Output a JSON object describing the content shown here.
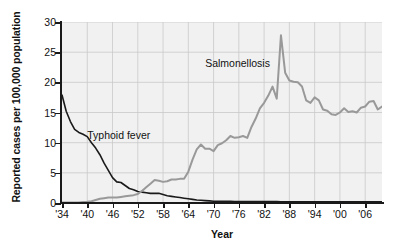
{
  "chart_data": {
    "type": "line",
    "title": "",
    "xlabel": "Year",
    "ylabel": "Reported cases per 100,000 population",
    "xlim": [
      1934,
      2010
    ],
    "ylim": [
      0,
      30
    ],
    "yticks": [
      0,
      5,
      10,
      15,
      20,
      25,
      30
    ],
    "ytick_labels": [
      "0",
      "5",
      "10",
      "15",
      "20",
      "25",
      "30"
    ],
    "xticks": [
      1934,
      1940,
      1946,
      1952,
      1958,
      1964,
      1970,
      1976,
      1982,
      1988,
      1994,
      2000,
      2006
    ],
    "xtick_labels": [
      "'34",
      "'40",
      "'46",
      "'52",
      "'58",
      "'64",
      "'70",
      "'76",
      "'82",
      "'88",
      "'94",
      "'00",
      "'06"
    ],
    "grid": true,
    "legend": "inline-annotations",
    "plot_background": "#f1f1f1",
    "series": [
      {
        "name": "Typhoid fever",
        "color": "#1a1a1a",
        "label_position": {
          "x": 1940,
          "y": 11.3
        },
        "x": [
          1934,
          1935,
          1936,
          1937,
          1938,
          1939,
          1940,
          1941,
          1942,
          1943,
          1944,
          1945,
          1946,
          1947,
          1948,
          1949,
          1950,
          1951,
          1952,
          1953,
          1954,
          1955,
          1956,
          1957,
          1958,
          1959,
          1960,
          1961,
          1962,
          1963,
          1964,
          1965,
          1966,
          1967,
          1968,
          1969,
          1970,
          1971,
          1972,
          1973,
          1974,
          1975,
          1976,
          1977,
          1978,
          1979,
          1980,
          1981,
          1982,
          1983,
          1984,
          1985,
          1986,
          1987,
          1988,
          1989,
          1990,
          1991,
          1992,
          1993,
          1994,
          1995,
          1996,
          1997,
          1998,
          1999,
          2000,
          2001,
          2002,
          2003,
          2004,
          2005,
          2006,
          2007,
          2008,
          2009,
          2010
        ],
        "values": [
          17.9,
          15.2,
          13.5,
          12.2,
          11.7,
          11.4,
          11.0,
          10.0,
          9.1,
          8.0,
          6.6,
          5.4,
          4.2,
          3.5,
          3.4,
          2.9,
          2.4,
          2.2,
          1.9,
          1.8,
          1.7,
          1.6,
          1.6,
          1.6,
          1.4,
          1.2,
          1.1,
          1.0,
          0.9,
          0.8,
          0.7,
          0.6,
          0.5,
          0.45,
          0.4,
          0.35,
          0.3,
          0.3,
          0.3,
          0.3,
          0.3,
          0.25,
          0.25,
          0.25,
          0.25,
          0.25,
          0.25,
          0.25,
          0.25,
          0.25,
          0.25,
          0.25,
          0.2,
          0.2,
          0.2,
          0.2,
          0.2,
          0.2,
          0.2,
          0.2,
          0.2,
          0.2,
          0.2,
          0.2,
          0.2,
          0.2,
          0.2,
          0.2,
          0.2,
          0.2,
          0.2,
          0.2,
          0.2,
          0.2,
          0.2,
          0.2,
          0.2
        ]
      },
      {
        "name": "Salmonellosis",
        "color": "#999999",
        "label_position": {
          "x": 1968,
          "y": 23.2
        },
        "x": [
          1934,
          1935,
          1936,
          1937,
          1938,
          1939,
          1940,
          1941,
          1942,
          1943,
          1944,
          1945,
          1946,
          1947,
          1948,
          1949,
          1950,
          1951,
          1952,
          1953,
          1954,
          1955,
          1956,
          1957,
          1958,
          1959,
          1960,
          1961,
          1962,
          1963,
          1964,
          1965,
          1966,
          1967,
          1968,
          1969,
          1970,
          1971,
          1972,
          1973,
          1974,
          1975,
          1976,
          1977,
          1978,
          1979,
          1980,
          1981,
          1982,
          1983,
          1984,
          1985,
          1986,
          1987,
          1988,
          1989,
          1990,
          1991,
          1992,
          1993,
          1994,
          1995,
          1996,
          1997,
          1998,
          1999,
          2000,
          2001,
          2002,
          2003,
          2004,
          2005,
          2006,
          2007,
          2008,
          2009,
          2010
        ],
        "values": [
          0.1,
          0.1,
          0.1,
          0.1,
          0.1,
          0.15,
          0.2,
          0.3,
          0.5,
          0.7,
          0.8,
          0.9,
          0.9,
          0.9,
          1.0,
          1.1,
          1.2,
          1.3,
          1.5,
          2.0,
          2.6,
          3.2,
          3.8,
          3.7,
          3.5,
          3.6,
          3.9,
          3.9,
          4.0,
          4.0,
          5.2,
          7.2,
          8.9,
          9.7,
          9.0,
          9.0,
          8.6,
          9.6,
          9.9,
          10.4,
          11.1,
          10.8,
          10.9,
          11.1,
          10.8,
          12.6,
          14.0,
          15.7,
          16.6,
          17.8,
          19.3,
          17.3,
          27.8,
          21.6,
          20.3,
          20.1,
          20.0,
          19.3,
          17.0,
          16.6,
          17.5,
          17.0,
          15.5,
          15.3,
          14.7,
          14.6,
          15.0,
          15.7,
          15.1,
          15.2,
          15.0,
          15.8,
          16.0,
          16.8,
          16.9,
          15.5,
          16.0
        ]
      }
    ]
  }
}
